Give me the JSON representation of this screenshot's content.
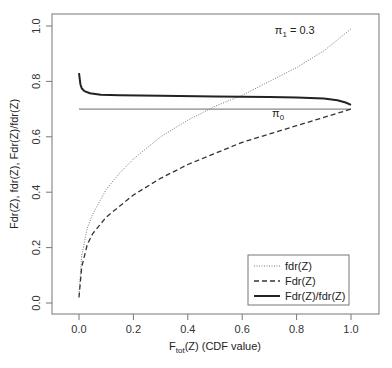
{
  "chart_data": {
    "type": "line",
    "title": "",
    "xlabel": "F_tot(Z) (CDF value)",
    "xlabel_main": "F",
    "xlabel_sub": "tot",
    "xlabel_rest": "(Z) (CDF value)",
    "ylabel": "Fdr(Z), fdr(Z), Fdr(Z)/fdr(Z)",
    "xlim": [
      0,
      1
    ],
    "ylim": [
      0,
      1
    ],
    "x_ticks": [
      "0.0",
      "0.2",
      "0.4",
      "0.6",
      "0.8",
      "1.0"
    ],
    "y_ticks": [
      "0.0",
      "0.2",
      "0.4",
      "0.6",
      "0.8",
      "1.0"
    ],
    "grid": false,
    "legend_position": "bottom-right",
    "annotations": [
      {
        "text": "π1 = 0.3",
        "main": "π",
        "sub": "1",
        "rest": " = 0.3",
        "x": 0.72,
        "y": 0.97
      },
      {
        "text": "π0",
        "main": "π",
        "sub": "0",
        "x": 0.71,
        "y": 0.67
      }
    ],
    "reference_line": {
      "label": "π0",
      "y": 0.7,
      "x": [
        0,
        1
      ]
    },
    "series": [
      {
        "name": "fdr(Z)",
        "style": "dotted",
        "x": [
          0.0,
          0.01,
          0.03,
          0.05,
          0.1,
          0.15,
          0.2,
          0.3,
          0.4,
          0.5,
          0.6,
          0.7,
          0.8,
          0.9,
          0.95,
          1.0
        ],
        "y": [
          0.03,
          0.17,
          0.27,
          0.32,
          0.41,
          0.47,
          0.52,
          0.6,
          0.66,
          0.71,
          0.75,
          0.8,
          0.85,
          0.91,
          0.95,
          0.99
        ]
      },
      {
        "name": "Fdr(Z)",
        "style": "dashed",
        "x": [
          0.0,
          0.01,
          0.03,
          0.05,
          0.1,
          0.15,
          0.2,
          0.3,
          0.4,
          0.5,
          0.6,
          0.7,
          0.8,
          0.9,
          1.0
        ],
        "y": [
          0.02,
          0.13,
          0.21,
          0.25,
          0.31,
          0.35,
          0.39,
          0.45,
          0.5,
          0.54,
          0.58,
          0.61,
          0.64,
          0.67,
          0.7
        ]
      },
      {
        "name": "Fdr(Z)/fdr(Z)",
        "style": "solid",
        "x": [
          0.0,
          0.005,
          0.01,
          0.02,
          0.04,
          0.08,
          0.15,
          0.3,
          0.5,
          0.7,
          0.8,
          0.9,
          0.95,
          0.98,
          1.0
        ],
        "y": [
          0.83,
          0.79,
          0.775,
          0.765,
          0.757,
          0.752,
          0.75,
          0.748,
          0.746,
          0.744,
          0.742,
          0.738,
          0.732,
          0.724,
          0.715
        ]
      }
    ]
  }
}
